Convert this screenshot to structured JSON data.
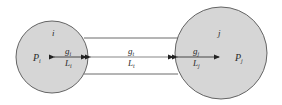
{
  "diagram": {
    "type": "two-node pore network with connecting throat",
    "colors": {
      "node_fill": "#d6d6d6",
      "node_stroke": "#555555",
      "line": "#333333",
      "background": "#ffffff"
    },
    "nodes": [
      {
        "id": "i",
        "label": "i",
        "pressure": {
          "base": "P",
          "sub": "i"
        },
        "conductance": {
          "base": "g",
          "sub": "i"
        },
        "length": {
          "base": "L",
          "sub": "i"
        }
      },
      {
        "id": "j",
        "label": "j",
        "pressure": {
          "base": "P",
          "sub": "j"
        },
        "conductance": {
          "base": "g",
          "sub": "j"
        },
        "length": {
          "base": "L",
          "sub": "j"
        }
      }
    ],
    "throat": {
      "conductance": {
        "base": "g",
        "sub": "t"
      },
      "length": {
        "base": "L",
        "sub": "t"
      }
    }
  }
}
